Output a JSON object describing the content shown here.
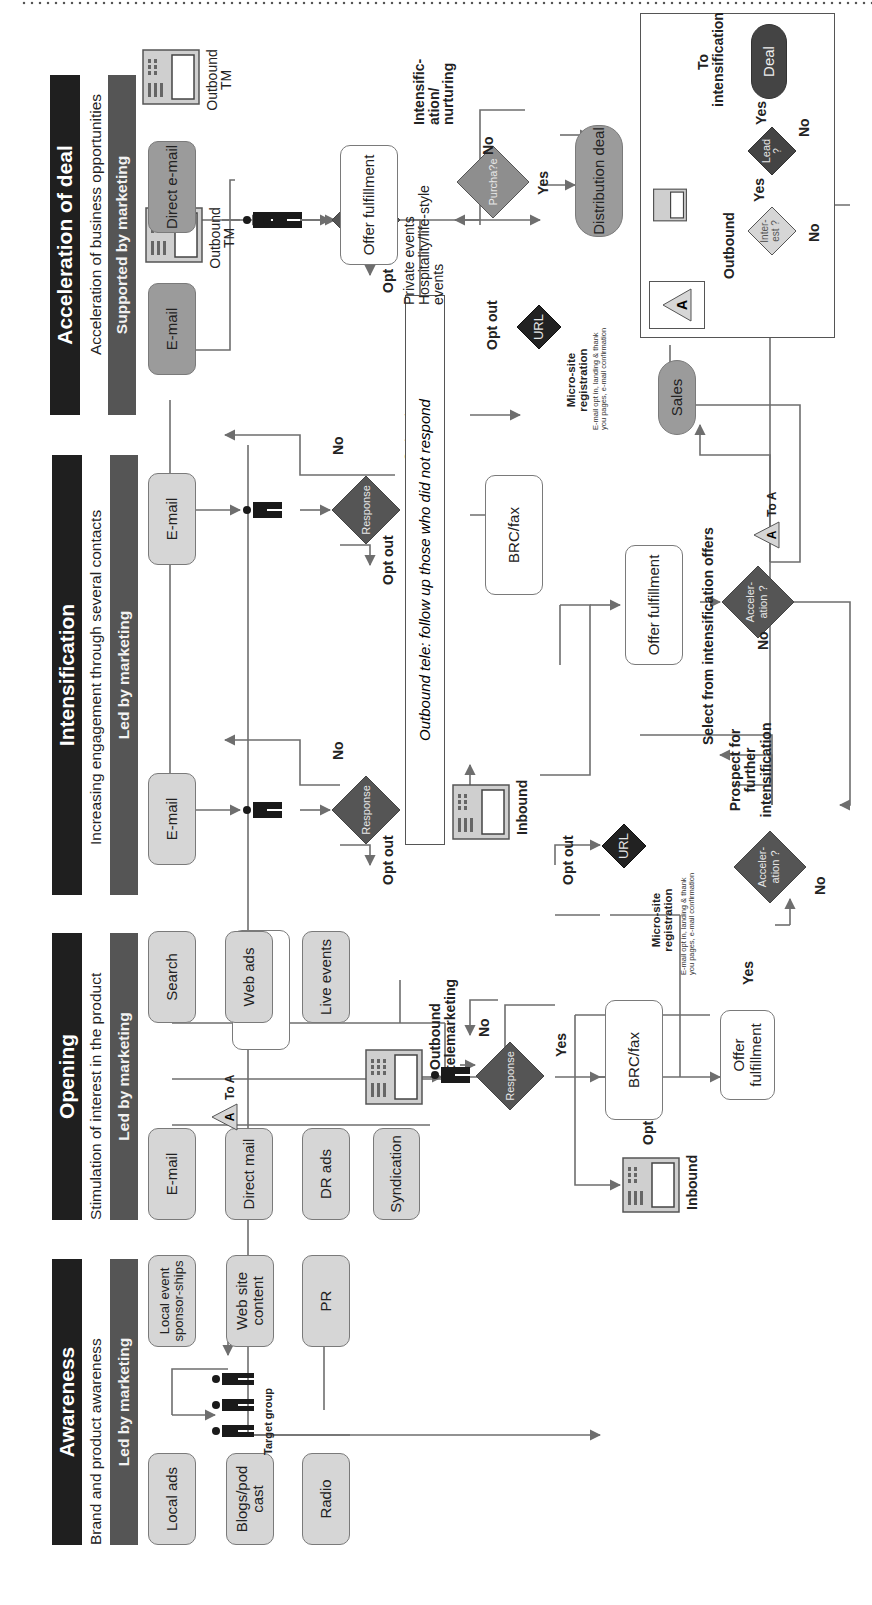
{
  "colors": {
    "header": "#1f1f1f",
    "lead_bar": "#555555",
    "light_box": "#d6d6d6",
    "dark_box": "#9b9b9b",
    "decision": "#555555",
    "url_decision": "#222222",
    "line": "#6e6e6e"
  },
  "icons": [
    "person-icon",
    "target-group-icon",
    "phone-icon",
    "decision-diamond",
    "connector-triangle-A",
    "arrow-icon"
  ],
  "awareness": {
    "title": "Awareness",
    "subtitle": "Brand and product awareness",
    "lead": "Led by marketing",
    "channels": [
      "Local ads",
      "Local event sponsor-ships",
      "Blogs/pod cast",
      "Web site content",
      "Radio",
      "PR"
    ],
    "target_group_label": "Target group",
    "destination": "Web site"
  },
  "opening": {
    "title": "Opening",
    "subtitle": "Stimulation of interest in the product",
    "lead": "Led by marketing",
    "channels": [
      "E-mail",
      "Search",
      "Direct mail",
      "Web ads",
      "DR ads",
      "Live events",
      "Syndication"
    ],
    "outbound_label": "Outbound telemarketing",
    "decision": "Response",
    "no": "No",
    "yes": "Yes",
    "opt_out": "Opt out",
    "inbound": "Inbound",
    "brc": "BRC/fax",
    "url": "URL",
    "microsite_title": "Micro-site registration",
    "microsite_note": "E-mail opt in, landing & thank you pages, e-mail confirmation",
    "offer": "Offer fulfillment",
    "acceleration": "Acceler-ation ?",
    "to_a": "To A",
    "connector": "A"
  },
  "intensification": {
    "title": "Intensification",
    "subtitle": "Increasing engagement through several contacts",
    "lead": "Led by marketing",
    "channels": [
      "E-mail",
      "E-mail",
      "Outbound TM"
    ],
    "decision": "Response",
    "no": "No",
    "opt_out": "Opt out",
    "followup": "Outbound tele: follow up those who did not respond",
    "inbound": "Inbound",
    "brc": "BRC/fax",
    "url": "URL",
    "microsite_title": "Micro-site registration",
    "microsite_note": "E-mail opt in, landing & thank you pages, e-mail confirmation",
    "offer": "Offer fulfillment",
    "select_label": "Select from intensification offers",
    "acceleration": "Acceler-ation ?",
    "prospect_label": "Prospect for further intensification",
    "sales": "Sales",
    "to_a": "To A",
    "connector": "A"
  },
  "acceleration": {
    "title": "Acceleration of deal",
    "subtitle": "Acceleration of business opportunities",
    "lead": "Supported by marketing",
    "channels": [
      "E-mail",
      "Direct e-mail",
      "Outbound TM"
    ],
    "offer": "Offer fulfillment",
    "offer_note": "Private events Hospitality/life-style events",
    "decision": "Purcha?e",
    "no": "No",
    "yes": "Yes",
    "nurture_label": "Intensific-ation/ nurturing",
    "deal": "Distribution deal",
    "inset": {
      "connector": "A",
      "outbound": "Outbound",
      "interest": "Inter-est ?",
      "lead": "Lead ?",
      "deal": "Deal",
      "yes1": "Yes",
      "yes2": "Yes",
      "no1": "No",
      "no2": "No",
      "to_intensification": "To intensification"
    }
  }
}
